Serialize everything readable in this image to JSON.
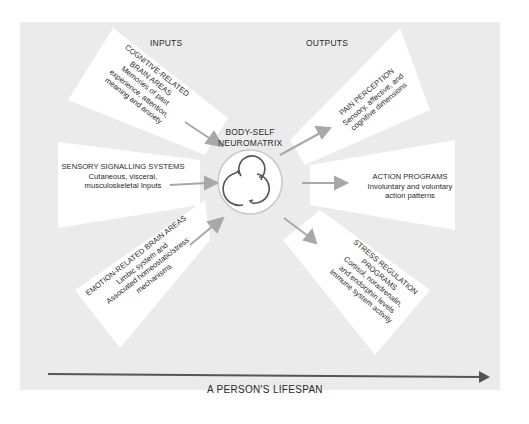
{
  "diagram": {
    "headers": {
      "inputs": "INPUTS",
      "outputs": "OUTPUTS"
    },
    "center": {
      "title_line1": "BODY-SELF",
      "title_line2": "NEUROMATRIX"
    },
    "inputs": [
      {
        "title_lines": [
          "COGNITIVE-RELATED",
          "BRAIN AREAS"
        ],
        "body_lines": [
          "Memories of past",
          "experience, attention,",
          "meaning and anxiety"
        ]
      },
      {
        "title_lines": [
          "SENSORY SIGNALLING SYSTEMS"
        ],
        "body_lines": [
          "Cutaneous, visceral,",
          "musculoskeletal Inputs"
        ]
      },
      {
        "title_lines": [
          "EMOTION-RELATED BRAIN AREAS"
        ],
        "body_lines": [
          "Limbic system and",
          "Associated homeostatic/stress",
          "mechanisms"
        ]
      }
    ],
    "outputs": [
      {
        "title_lines": [
          "PAIN PERCEPTION"
        ],
        "body_lines": [
          "Sensory, affective, and",
          "cognitive dimensions"
        ]
      },
      {
        "title_lines": [
          "ACTION PROGRAMS"
        ],
        "body_lines": [
          "Involuntary and voluntary",
          "action patterns"
        ]
      },
      {
        "title_lines": [
          "STRESS REGULATION",
          "PROGRAMS"
        ],
        "body_lines": [
          "Cortisol, noradrenalin,",
          "and endorphin levels",
          "Immune system activity"
        ]
      }
    ],
    "timeline": {
      "label": "A PERSON'S LIFESPAN"
    },
    "colors": {
      "background": "#ebebeb",
      "panel": "#ffffff",
      "arrow": "#a8a8a8",
      "text": "#2a2a2a",
      "timeline": "#555555"
    }
  }
}
